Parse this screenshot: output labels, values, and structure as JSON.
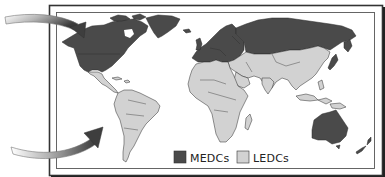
{
  "map": {
    "title": "World map of MEDCs and LEDCs",
    "colors": {
      "medc": "#4a4a4a",
      "ledc": "#d2d2d2",
      "border": "#2a2a2a",
      "ocean": "#ffffff",
      "frame": "#333333"
    },
    "legend": {
      "items": [
        {
          "key": "medc",
          "label": "MEDCs",
          "color": "#4a4a4a"
        },
        {
          "key": "ledc",
          "label": "LEDCs",
          "color": "#d2d2d2"
        }
      ]
    },
    "arrows": [
      {
        "name": "arrow-to-north",
        "points_to": "North America (MEDCs)"
      },
      {
        "name": "arrow-to-south",
        "points_to": "South America (LEDCs)"
      }
    ],
    "regions": [
      {
        "name": "North America",
        "class": "medc"
      },
      {
        "name": "Greenland",
        "class": "medc"
      },
      {
        "name": "Europe",
        "class": "medc"
      },
      {
        "name": "Russia",
        "class": "medc"
      },
      {
        "name": "Japan",
        "class": "medc"
      },
      {
        "name": "Australia",
        "class": "medc"
      },
      {
        "name": "New Zealand",
        "class": "medc"
      },
      {
        "name": "Central America",
        "class": "ledc"
      },
      {
        "name": "South America",
        "class": "ledc"
      },
      {
        "name": "Africa",
        "class": "ledc"
      },
      {
        "name": "Middle East",
        "class": "ledc"
      },
      {
        "name": "Asia",
        "class": "ledc"
      },
      {
        "name": "South-East Asia",
        "class": "ledc"
      }
    ]
  }
}
